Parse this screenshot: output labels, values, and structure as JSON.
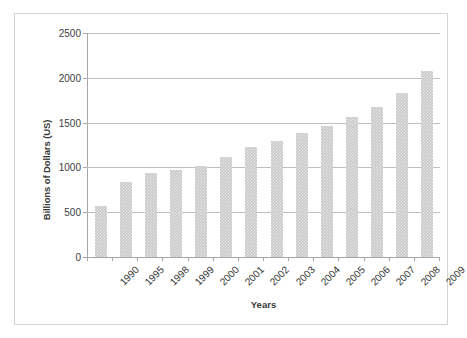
{
  "chart_data": {
    "type": "bar",
    "title": "",
    "xlabel": "Years",
    "ylabel": "Billions of Dollars (US)",
    "categories": [
      "1990",
      "1995",
      "1998",
      "1999",
      "2000",
      "2001",
      "2002",
      "2003",
      "2004",
      "2005",
      "2006",
      "2007",
      "2008",
      "2009"
    ],
    "values": [
      570,
      840,
      940,
      975,
      1020,
      1120,
      1230,
      1300,
      1380,
      1465,
      1565,
      1670,
      1830,
      2080
    ],
    "series": [
      {
        "name": "Billions of Dollars (US)",
        "values": [
          570,
          840,
          940,
          975,
          1020,
          1120,
          1230,
          1300,
          1380,
          1465,
          1565,
          1670,
          1830,
          2080
        ]
      }
    ],
    "ylim": [
      0,
      2500
    ],
    "ytick_labels": [
      "0",
      "500",
      "1000",
      "1500",
      "2000",
      "2500"
    ],
    "ytick_values": [
      0,
      500,
      1000,
      1500,
      2000,
      2500
    ],
    "grid": "horizontal",
    "legend": "none",
    "bar_color": "#c9c9c9",
    "gridline_color": "#bfbfbf",
    "axis_color": "#a6a6a6",
    "frame_color": "#d4d4d4",
    "text_color": "#333333"
  }
}
